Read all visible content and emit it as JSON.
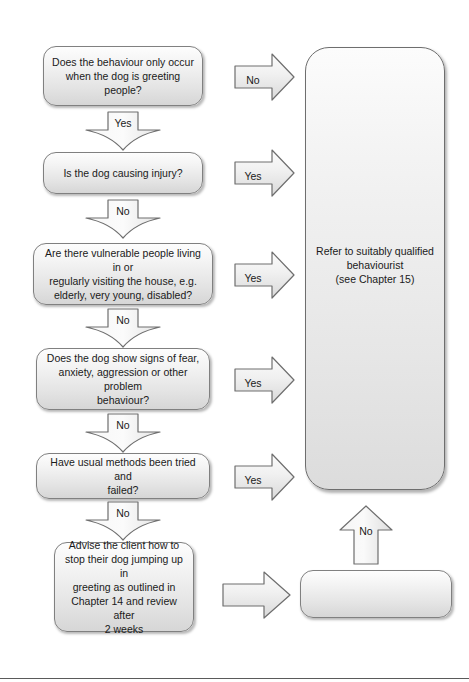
{
  "page": {
    "background_color": "#ffffff",
    "box_fill_top": "#fdfdfd",
    "box_fill_bottom": "#d6d6d6",
    "box_border_color": "#808080",
    "text_color": "#1a1a1a"
  },
  "nodes": {
    "q1": "Does the behaviour only occur\nwhen the dog is greeting people?",
    "q2": "Is the dog causing injury?",
    "q3": "Are there vulnerable people living in or\nregularly visiting the house, e.g.\nelderly, very young, disabled?",
    "q4": "Does the dog show signs of fear,\nanxiety, aggression or other problem\nbehaviour?",
    "q5": "Have usual methods been tried and\nfailed?",
    "action": "Advise the client how to\nstop their dog jumping up in\ngreeting as outlined in\nChapter 14 and review after\n2 weeks",
    "refer": "Refer to suitably qualified\nbehaviourist\n(see Chapter 15)",
    "q6": "Has the behaviour resolved?"
  },
  "arrows": {
    "a1_right_no": "No",
    "a1_down_yes": "Yes",
    "a2_right_yes": "Yes",
    "a2_down_no": "No",
    "a3_right_yes": "Yes",
    "a3_down_no": "No",
    "a4_right_yes": "Yes",
    "a4_down_no": "No",
    "a5_right_yes": "Yes",
    "a5_down_no": "No",
    "a6_right_blank": "",
    "a6_up_no": "No"
  }
}
